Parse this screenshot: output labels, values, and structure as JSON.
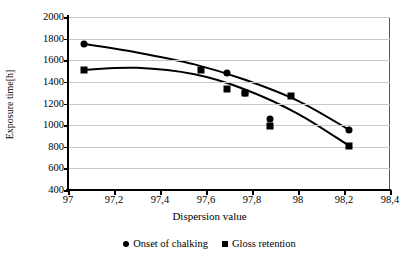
{
  "chart_data": {
    "type": "scatter",
    "title": "",
    "xlabel": "Dispersion value",
    "ylabel": "Exposure time[h]",
    "xlim": [
      97,
      98.4
    ],
    "ylim": [
      400,
      2000
    ],
    "xticks": [
      "97",
      "97,2",
      "97,4",
      "97,6",
      "97,8",
      "98",
      "98,2",
      "98,4"
    ],
    "xtick_values": [
      97,
      97.2,
      97.4,
      97.6,
      97.8,
      98,
      98.2,
      98.4
    ],
    "yticks": [
      "400",
      "600",
      "800",
      "1000",
      "1200",
      "1400",
      "1600",
      "1800",
      "2000"
    ],
    "ytick_values": [
      400,
      600,
      800,
      1000,
      1200,
      1400,
      1600,
      1800,
      2000
    ],
    "grid": "horizontal",
    "legend_position": "bottom-center",
    "series": [
      {
        "name": "Onset of chalking",
        "marker": "circle",
        "color": "#000000",
        "points": [
          {
            "x": 97.07,
            "y": 1750
          },
          {
            "x": 97.69,
            "y": 1485
          },
          {
            "x": 97.77,
            "y": 1295
          },
          {
            "x": 97.88,
            "y": 1060
          },
          {
            "x": 98.22,
            "y": 955
          }
        ],
        "trend_curve": [
          {
            "x": 97.07,
            "y": 1750
          },
          {
            "x": 97.3,
            "y": 1672
          },
          {
            "x": 97.55,
            "y": 1562
          },
          {
            "x": 97.77,
            "y": 1420
          },
          {
            "x": 98.0,
            "y": 1225
          },
          {
            "x": 98.22,
            "y": 960
          }
        ]
      },
      {
        "name": "Gloss retention",
        "marker": "square",
        "color": "#000000",
        "points": [
          {
            "x": 97.07,
            "y": 1510
          },
          {
            "x": 97.58,
            "y": 1510
          },
          {
            "x": 97.69,
            "y": 1330
          },
          {
            "x": 97.77,
            "y": 1300
          },
          {
            "x": 97.88,
            "y": 990
          },
          {
            "x": 97.97,
            "y": 1270
          },
          {
            "x": 98.22,
            "y": 805
          }
        ],
        "trend_curve": [
          {
            "x": 97.07,
            "y": 1512
          },
          {
            "x": 97.3,
            "y": 1530
          },
          {
            "x": 97.55,
            "y": 1470
          },
          {
            "x": 97.77,
            "y": 1330
          },
          {
            "x": 98.0,
            "y": 1105
          },
          {
            "x": 98.22,
            "y": 812
          }
        ]
      }
    ]
  }
}
